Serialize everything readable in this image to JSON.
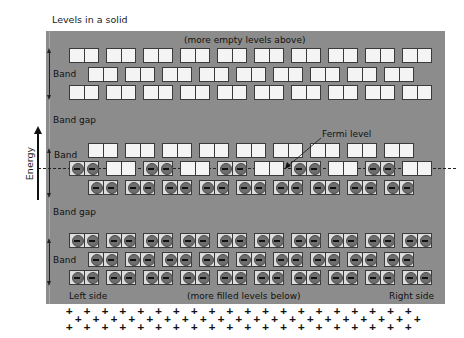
{
  "title": "Levels in a solid",
  "axis": {
    "label": "Energy",
    "icon": "up-arrow-icon"
  },
  "annotations": {
    "top": "(more empty levels above)",
    "bottom": "(more filled levels below)",
    "left_side": "Left side",
    "right_side": "Right side",
    "fermi_level": "Fermi level"
  },
  "regions": [
    {
      "label": "Band",
      "kind": "band"
    },
    {
      "label": "Band gap",
      "kind": "gap"
    },
    {
      "label": "Band",
      "kind": "band"
    },
    {
      "label": "Band gap",
      "kind": "gap"
    },
    {
      "label": "Band",
      "kind": "band"
    }
  ],
  "colors": {
    "panel": "#8c8c8c",
    "empty_cell": "#f4f4f4",
    "filled_cell": "#dcdcdc",
    "electron": "#6e6e6e",
    "outline": "#3a3a3a"
  },
  "rows": [
    {
      "y": 48,
      "x0": 69,
      "count": 10,
      "pattern": "empty"
    },
    {
      "y": 67,
      "x0": 88,
      "count": 9,
      "pattern": "empty"
    },
    {
      "y": 85,
      "x0": 69,
      "count": 10,
      "pattern": "empty"
    },
    {
      "y": 143,
      "x0": 88,
      "count": 9,
      "pattern": "empty"
    },
    {
      "y": 161,
      "x0": 69,
      "count": 10,
      "pattern": "alternate"
    },
    {
      "y": 180,
      "x0": 88,
      "count": 9,
      "pattern": "filled"
    },
    {
      "y": 233,
      "x0": 69,
      "count": 10,
      "pattern": "filled"
    },
    {
      "y": 252,
      "x0": 88,
      "count": 9,
      "pattern": "filled"
    },
    {
      "y": 270,
      "x0": 69,
      "count": 10,
      "pattern": "filled"
    }
  ],
  "box_pitch": 37,
  "positive_ions": {
    "symbol": "+",
    "rows": 3
  }
}
